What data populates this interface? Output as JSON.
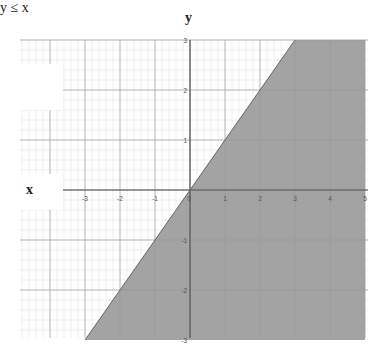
{
  "chart_data": {
    "type": "area",
    "title": "y ≤ x",
    "xlabel": "x",
    "ylabel": "y",
    "xlim": [
      -5,
      5
    ],
    "ylim": [
      -3,
      3
    ],
    "x_ticks": [
      "-3",
      "-2",
      "-1",
      "0",
      "1",
      "2",
      "3",
      "4",
      "5"
    ],
    "y_ticks": [
      "3",
      "2",
      "1",
      "0",
      "-1",
      "-2",
      "-3"
    ],
    "grid": true,
    "series": [
      {
        "name": "boundary y = x",
        "type": "line",
        "x": [
          -3,
          3
        ],
        "y": [
          -3,
          3
        ]
      },
      {
        "name": "shaded region y ≤ x",
        "type": "area",
        "polygon": [
          [
            -3,
            -3
          ],
          [
            3,
            3
          ],
          [
            5,
            3
          ],
          [
            5,
            -3
          ]
        ]
      }
    ],
    "colors": {
      "shade": "#a3a3a3",
      "grid_minor": "#e4e4e4",
      "grid_major": "#c8c8c8",
      "axis": "#555555"
    }
  },
  "labels": {
    "y_axis": "y",
    "x_axis": "x",
    "inequality": "y ≤ x"
  }
}
